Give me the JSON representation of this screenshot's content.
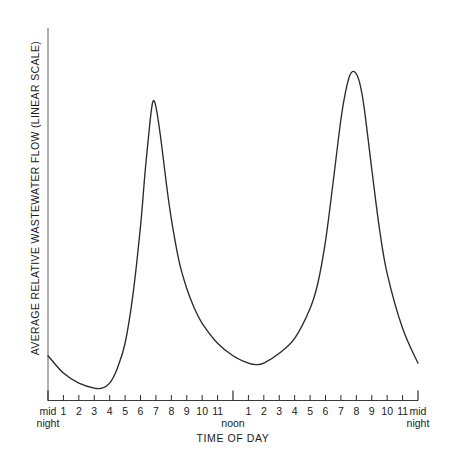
{
  "chart_data": {
    "type": "line",
    "title": "",
    "xlabel": "TIME OF DAY",
    "ylabel": "AVERAGE RELATIVE WASTEWATER FLOW (LINEAR SCALE)",
    "grid": false,
    "legend": "none",
    "xlim": [
      0,
      24
    ],
    "ylim": [
      0,
      1
    ],
    "x_tick_labels": [
      "mid\nnight",
      "1",
      "2",
      "3",
      "4",
      "5",
      "6",
      "7",
      "8",
      "9",
      "10",
      "11",
      "noon",
      "1",
      "2",
      "3",
      "4",
      "5",
      "6",
      "7",
      "8",
      "9",
      "10",
      "11",
      "mid\nnight"
    ],
    "x_major_ticks": [
      "mid night",
      "noon",
      "mid night"
    ],
    "y_tick_labels": [],
    "series": [
      {
        "name": "Average relative wastewater flow",
        "x": [
          0,
          1,
          2,
          3,
          3.5,
          4,
          4.5,
          5,
          5.5,
          6,
          6.3,
          6.6,
          6.8,
          7,
          7.3,
          7.7,
          8,
          8.5,
          9,
          9.5,
          10,
          11,
          12,
          13,
          13.5,
          14,
          15,
          16,
          17,
          17.5,
          18,
          18.5,
          19,
          19.3,
          19.6,
          19.9,
          20.2,
          20.5,
          21,
          21.5,
          22,
          23,
          24
        ],
        "y": [
          0.29,
          0.255,
          0.235,
          0.225,
          0.225,
          0.235,
          0.265,
          0.315,
          0.41,
          0.55,
          0.66,
          0.755,
          0.8,
          0.79,
          0.73,
          0.63,
          0.565,
          0.48,
          0.425,
          0.385,
          0.355,
          0.315,
          0.29,
          0.275,
          0.272,
          0.275,
          0.295,
          0.325,
          0.385,
          0.435,
          0.52,
          0.64,
          0.765,
          0.82,
          0.855,
          0.86,
          0.84,
          0.79,
          0.665,
          0.545,
          0.455,
          0.345,
          0.275
        ]
      }
    ],
    "annotations": {
      "morning_peak_time": "approximately 7 a.m.",
      "evening_peak_time": "approximately 8 p.m.",
      "minimum_time": "approximately 3-4 a.m."
    },
    "colors": {
      "curve": "#2b2b2b",
      "axis": "#8d8d8d",
      "tick": "#2b2b2b",
      "background": "#ffffff"
    }
  },
  "axis": {
    "y_axis_label": "AVERAGE RELATIVE WASTEWATER FLOW (LINEAR SCALE)",
    "x_axis_title": "TIME OF DAY",
    "ticks": [
      {
        "label_line1": "mid",
        "label_line2": "night",
        "hour": 0,
        "major": true
      },
      {
        "label_line1": "1",
        "label_line2": "",
        "hour": 1,
        "major": false
      },
      {
        "label_line1": "2",
        "label_line2": "",
        "hour": 2,
        "major": false
      },
      {
        "label_line1": "3",
        "label_line2": "",
        "hour": 3,
        "major": false
      },
      {
        "label_line1": "4",
        "label_line2": "",
        "hour": 4,
        "major": false
      },
      {
        "label_line1": "5",
        "label_line2": "",
        "hour": 5,
        "major": false
      },
      {
        "label_line1": "6",
        "label_line2": "",
        "hour": 6,
        "major": false
      },
      {
        "label_line1": "7",
        "label_line2": "",
        "hour": 7,
        "major": false
      },
      {
        "label_line1": "8",
        "label_line2": "",
        "hour": 8,
        "major": false
      },
      {
        "label_line1": "9",
        "label_line2": "",
        "hour": 9,
        "major": false
      },
      {
        "label_line1": "10",
        "label_line2": "",
        "hour": 10,
        "major": false
      },
      {
        "label_line1": "11",
        "label_line2": "",
        "hour": 11,
        "major": false
      },
      {
        "label_line1": "",
        "label_line2": "noon",
        "hour": 12,
        "major": true
      },
      {
        "label_line1": "1",
        "label_line2": "",
        "hour": 13,
        "major": false
      },
      {
        "label_line1": "2",
        "label_line2": "",
        "hour": 14,
        "major": false
      },
      {
        "label_line1": "3",
        "label_line2": "",
        "hour": 15,
        "major": false
      },
      {
        "label_line1": "4",
        "label_line2": "",
        "hour": 16,
        "major": false
      },
      {
        "label_line1": "5",
        "label_line2": "",
        "hour": 17,
        "major": false
      },
      {
        "label_line1": "6",
        "label_line2": "",
        "hour": 18,
        "major": false
      },
      {
        "label_line1": "7",
        "label_line2": "",
        "hour": 19,
        "major": false
      },
      {
        "label_line1": "8",
        "label_line2": "",
        "hour": 20,
        "major": false
      },
      {
        "label_line1": "9",
        "label_line2": "",
        "hour": 21,
        "major": false
      },
      {
        "label_line1": "10",
        "label_line2": "",
        "hour": 22,
        "major": false
      },
      {
        "label_line1": "11",
        "label_line2": "",
        "hour": 23,
        "major": false
      },
      {
        "label_line1": "mid",
        "label_line2": "night",
        "hour": 24,
        "major": true
      }
    ]
  }
}
